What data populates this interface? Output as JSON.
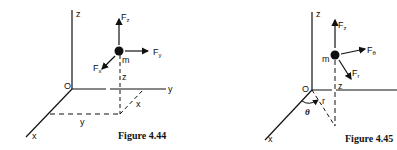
{
  "figures": [
    {
      "caption": "Figure 4.44",
      "origin_label": "O",
      "axes": {
        "x": "x",
        "y": "y",
        "z": "z"
      },
      "mass_label": "m",
      "height_label": "z",
      "projection_labels": {
        "y": "y",
        "x": "x"
      },
      "forces": [
        {
          "base": "F",
          "sub": "z"
        },
        {
          "base": "F",
          "sub": "y"
        },
        {
          "base": "F",
          "sub": "x"
        }
      ]
    },
    {
      "caption": "Figure 4.45",
      "origin_label": "O",
      "axes": {
        "x": "x",
        "z": "z"
      },
      "mass_label": "m",
      "height_label": "z",
      "radius_label": "r",
      "angle_label": "θ",
      "forces": [
        {
          "base": "F",
          "sub": "z"
        },
        {
          "base": "F",
          "sub": "θ"
        },
        {
          "base": "F",
          "sub": "r"
        }
      ]
    }
  ]
}
